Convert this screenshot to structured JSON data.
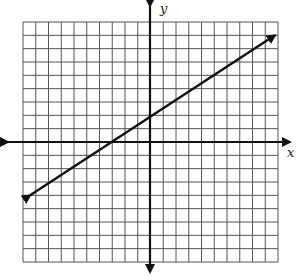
{
  "chart_data": {
    "type": "line",
    "title": "",
    "xlabel": "x",
    "ylabel": "y",
    "grid": true,
    "tick_labels_shown": false,
    "grid_cells": {
      "x": 20,
      "y": 18
    },
    "xlim_approx": [
      -10,
      10
    ],
    "ylim_approx": [
      -9,
      9
    ],
    "series": [
      {
        "name": "line",
        "note": "Endpoints estimated by counting grid squares; no tick labels are shown, so values are approximate.",
        "x": [
          -9.4,
          9.8
        ],
        "y": [
          -4,
          8
        ],
        "slope_approx": 0.6,
        "y_intercept_approx": 2,
        "x_intercept_approx": -3.5,
        "arrows": [
          "start",
          "end"
        ]
      }
    ],
    "legend": null
  },
  "axes": {
    "x_label": "x",
    "y_label": "y"
  },
  "colors": {
    "grid": "#555555",
    "axis": "#111111",
    "line": "#111111"
  }
}
